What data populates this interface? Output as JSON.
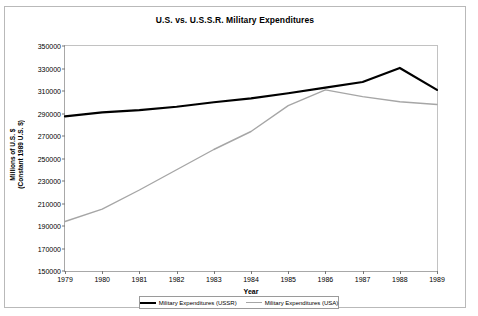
{
  "chart_data": {
    "type": "line",
    "title": "U.S. vs. U.S.S.R. Military Expenditures",
    "xlabel": "Year",
    "ylabel_line1": "Millions of U.S. $",
    "ylabel_line2": "(Constant 1989 U.S. $)",
    "categories": [
      "1979",
      "1980",
      "1981",
      "1982",
      "1983",
      "1984",
      "1985",
      "1986",
      "1987",
      "1988",
      "1989"
    ],
    "x": [
      1979,
      1980,
      1981,
      1982,
      1983,
      1984,
      1985,
      1986,
      1987,
      1988,
      1989
    ],
    "xlim": [
      1979,
      1989
    ],
    "ylim": [
      150000,
      350000
    ],
    "yticks": [
      150000,
      170000,
      190000,
      210000,
      230000,
      250000,
      270000,
      290000,
      310000,
      330000,
      350000
    ],
    "ytick_labels": [
      "150000",
      "170000",
      "190000",
      "210000",
      "230000",
      "250000",
      "270000",
      "290000",
      "310000",
      "330000",
      "350000"
    ],
    "grid": false,
    "legend_position": "bottom",
    "series": [
      {
        "name": "Military Expenditures (USSR)",
        "color": "#000000",
        "width": 2.2,
        "values": [
          287500,
          291000,
          293000,
          296000,
          300000,
          303500,
          308000,
          313000,
          318000,
          330500,
          311000
        ]
      },
      {
        "name": "Military Expenditures (USA)",
        "color": "#a6a6a6",
        "width": 1.4,
        "values": [
          194000,
          205000,
          222000,
          240000,
          258000,
          274000,
          297000,
          311000,
          305000,
          300500,
          298000
        ]
      }
    ]
  },
  "colors": {
    "frame_border": "#b9b9b9",
    "axis": "#a8a8a8",
    "text": "#000000"
  }
}
